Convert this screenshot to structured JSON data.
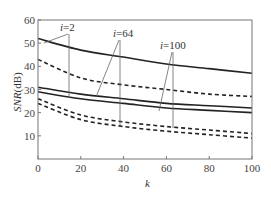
{
  "chart_data": {
    "type": "line",
    "title": "",
    "xlabel": "k",
    "ylabel": "SNR(dB)",
    "xlim": [
      0,
      100
    ],
    "ylim": [
      0,
      60
    ],
    "xticks": [
      0,
      20,
      40,
      60,
      80,
      100
    ],
    "yticks": [
      10,
      20,
      30,
      40,
      50,
      60
    ],
    "grid": false,
    "legend": "none (inline annotations)",
    "x": [
      0,
      20,
      40,
      60,
      80,
      100
    ],
    "series": [
      {
        "name": "i=2 (solid)",
        "style": "solid",
        "values": [
          52,
          47,
          44,
          41,
          39,
          37
        ]
      },
      {
        "name": "i=2 (dashed)",
        "style": "dashed",
        "values": [
          43,
          35,
          32,
          30,
          28,
          27
        ]
      },
      {
        "name": "i=64 (solid)",
        "style": "solid",
        "values": [
          31,
          28,
          26,
          24,
          23,
          22
        ]
      },
      {
        "name": "i=100 (solid)",
        "style": "solid",
        "values": [
          29,
          26,
          24,
          22,
          21,
          20
        ]
      },
      {
        "name": "i=64 (dashed)",
        "style": "dashed",
        "values": [
          26,
          19,
          16,
          14,
          12.5,
          11
        ]
      },
      {
        "name": "i=100 (dashed)",
        "style": "dashed",
        "values": [
          24,
          17,
          14,
          12,
          10.5,
          9
        ]
      }
    ],
    "annotations": [
      {
        "text": "i=2",
        "targets": [
          "i=2 (solid)",
          "i=2 (dashed)"
        ]
      },
      {
        "text": "i=64",
        "targets": [
          "i=64 (solid)",
          "i=64 (dashed)"
        ]
      },
      {
        "text": "i=100",
        "targets": [
          "i=100 (solid)",
          "i=100 (dashed)"
        ]
      }
    ]
  },
  "labels": {
    "x_axis": "k",
    "y_axis": "SNR(dB)",
    "ann_i2": "i=2",
    "ann_i64": "i=64",
    "ann_i100": "i=100"
  }
}
